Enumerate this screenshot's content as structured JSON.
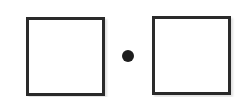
{
  "diagram": {
    "left_box": {
      "value": ""
    },
    "operator": {
      "symbol": "·",
      "meaning": "multiply"
    },
    "right_box": {
      "value": ""
    },
    "colors": {
      "stroke": "#2a2a2a",
      "dot": "#1e1e1e",
      "background": "#ffffff"
    }
  }
}
